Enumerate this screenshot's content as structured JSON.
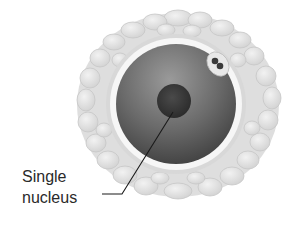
{
  "diagram": {
    "label": {
      "line1": "Single",
      "line2": "nucleus"
    },
    "colors": {
      "cumulus_fill": "#e2e2e2",
      "cumulus_stroke": "#c4c4c4",
      "zona_ring": "#f4f4f4",
      "cytoplasm_dark": "#4a4a4a",
      "cytoplasm_light": "#8a8a8a",
      "nucleus": "#333333",
      "leader_line": "#1a1a1a"
    }
  }
}
